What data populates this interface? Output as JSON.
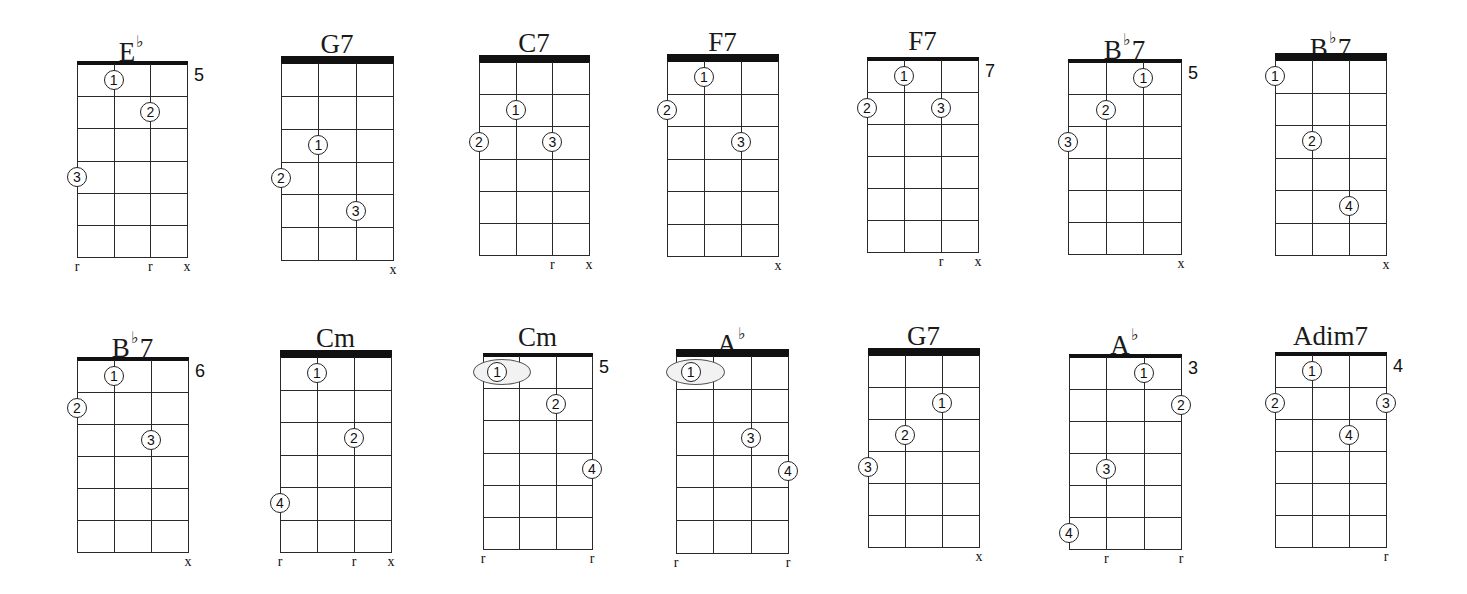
{
  "instrument": {
    "strings": 4,
    "frets_shown": 6
  },
  "colors": {
    "ink": "#111111",
    "background": "#ffffff",
    "barre_fill": "#f2f2f2"
  },
  "chords": [
    {
      "name": "E",
      "accidental": "♭",
      "suffix": "",
      "position": "5",
      "left": 77,
      "right": 187,
      "top": 64,
      "bottom": 257,
      "nut": "thin",
      "fingers": [
        {
          "n": "1",
          "s": 1,
          "f": 1
        },
        {
          "n": "2",
          "s": 2,
          "f": 2
        },
        {
          "n": "3",
          "s": 0,
          "f": 4
        }
      ],
      "markers": [
        {
          "s": 0,
          "m": "r"
        },
        {
          "s": 2,
          "m": "r"
        },
        {
          "s": 3,
          "m": "x"
        }
      ]
    },
    {
      "name": "G",
      "accidental": "",
      "suffix": "7",
      "position": "",
      "left": 281,
      "right": 393,
      "top": 63,
      "bottom": 260,
      "nut": "thick",
      "fingers": [
        {
          "n": "1",
          "s": 1,
          "f": 3
        },
        {
          "n": "2",
          "s": 0,
          "f": 4
        },
        {
          "n": "3",
          "s": 2,
          "f": 5
        }
      ],
      "markers": [
        {
          "s": 3,
          "m": "x"
        }
      ]
    },
    {
      "name": "C",
      "accidental": "",
      "suffix": "7",
      "position": "",
      "left": 479,
      "right": 589,
      "top": 62,
      "bottom": 255,
      "nut": "thick",
      "fingers": [
        {
          "n": "1",
          "s": 1,
          "f": 2
        },
        {
          "n": "2",
          "s": 0,
          "f": 3
        },
        {
          "n": "3",
          "s": 2,
          "f": 3
        }
      ],
      "markers": [
        {
          "s": 2,
          "m": "r"
        },
        {
          "s": 3,
          "m": "x"
        }
      ]
    },
    {
      "name": "F",
      "accidental": "",
      "suffix": "7",
      "position": "",
      "left": 667,
      "right": 778,
      "top": 61,
      "bottom": 256,
      "nut": "thick",
      "fingers": [
        {
          "n": "1",
          "s": 1,
          "f": 1
        },
        {
          "n": "2",
          "s": 0,
          "f": 2
        },
        {
          "n": "3",
          "s": 2,
          "f": 3
        }
      ],
      "markers": [
        {
          "s": 3,
          "m": "x"
        }
      ]
    },
    {
      "name": "F",
      "accidental": "",
      "suffix": "7",
      "position": "7",
      "left": 867,
      "right": 978,
      "top": 60,
      "bottom": 252,
      "nut": "thin",
      "fingers": [
        {
          "n": "1",
          "s": 1,
          "f": 1
        },
        {
          "n": "2",
          "s": 0,
          "f": 2
        },
        {
          "n": "3",
          "s": 2,
          "f": 2
        }
      ],
      "markers": [
        {
          "s": 2,
          "m": "r"
        },
        {
          "s": 3,
          "m": "x"
        }
      ]
    },
    {
      "name": "B",
      "accidental": "♭",
      "suffix": "7",
      "position": "5",
      "left": 1068,
      "right": 1181,
      "top": 62,
      "bottom": 254,
      "nut": "thin",
      "fingers": [
        {
          "n": "1",
          "s": 2,
          "f": 1
        },
        {
          "n": "2",
          "s": 1,
          "f": 2
        },
        {
          "n": "3",
          "s": 0,
          "f": 3
        }
      ],
      "markers": [
        {
          "s": 3,
          "m": "x"
        }
      ]
    },
    {
      "name": "B",
      "accidental": "♭",
      "suffix": "7",
      "position": "",
      "left": 1275,
      "right": 1386,
      "top": 60,
      "bottom": 255,
      "nut": "thick",
      "fingers": [
        {
          "n": "1",
          "s": 0,
          "f": 1
        },
        {
          "n": "2",
          "s": 1,
          "f": 3
        },
        {
          "n": "4",
          "s": 2,
          "f": 5
        }
      ],
      "markers": [
        {
          "s": 3,
          "m": "x"
        }
      ]
    },
    {
      "name": "B",
      "accidental": "♭",
      "suffix": "7",
      "position": "6",
      "left": 77,
      "right": 188,
      "top": 360,
      "bottom": 552,
      "nut": "thin",
      "fingers": [
        {
          "n": "1",
          "s": 1,
          "f": 1
        },
        {
          "n": "2",
          "s": 0,
          "f": 2
        },
        {
          "n": "3",
          "s": 2,
          "f": 3
        }
      ],
      "markers": [
        {
          "s": 3,
          "m": "x"
        }
      ]
    },
    {
      "name": "Cm",
      "accidental": "",
      "suffix": "",
      "position": "",
      "left": 280,
      "right": 391,
      "top": 357,
      "bottom": 552,
      "nut": "thick",
      "fingers": [
        {
          "n": "1",
          "s": 1,
          "f": 1
        },
        {
          "n": "2",
          "s": 2,
          "f": 3
        },
        {
          "n": "4",
          "s": 0,
          "f": 5
        }
      ],
      "markers": [
        {
          "s": 0,
          "m": "r"
        },
        {
          "s": 2,
          "m": "r"
        },
        {
          "s": 3,
          "m": "x"
        }
      ]
    },
    {
      "name": "Cm",
      "accidental": "",
      "suffix": "",
      "position": "5",
      "left": 483,
      "right": 592,
      "top": 356,
      "bottom": 549,
      "nut": "thin",
      "barre": {
        "f": 1,
        "from": 0,
        "to": 1,
        "n": "1"
      },
      "fingers": [
        {
          "n": "2",
          "s": 2,
          "f": 2
        },
        {
          "n": "4",
          "s": 3,
          "f": 4
        }
      ],
      "markers": [
        {
          "s": 0,
          "m": "r"
        },
        {
          "s": 3,
          "m": "r"
        }
      ]
    },
    {
      "name": "A",
      "accidental": "♭",
      "suffix": "",
      "position": "",
      "left": 676,
      "right": 788,
      "top": 356,
      "bottom": 553,
      "nut": "thick",
      "barre": {
        "f": 1,
        "from": 0,
        "to": 1,
        "n": "1"
      },
      "fingers": [
        {
          "n": "3",
          "s": 2,
          "f": 3
        },
        {
          "n": "4",
          "s": 3,
          "f": 4
        }
      ],
      "markers": [
        {
          "s": 0,
          "m": "r"
        },
        {
          "s": 3,
          "m": "r"
        }
      ]
    },
    {
      "name": "G",
      "accidental": "",
      "suffix": "7",
      "position": "",
      "left": 868,
      "right": 979,
      "top": 355,
      "bottom": 547,
      "nut": "thick",
      "fingers": [
        {
          "n": "1",
          "s": 2,
          "f": 2
        },
        {
          "n": "2",
          "s": 1,
          "f": 3
        },
        {
          "n": "3",
          "s": 0,
          "f": 4
        }
      ],
      "markers": [
        {
          "s": 3,
          "m": "x"
        }
      ]
    },
    {
      "name": "A",
      "accidental": "♭",
      "suffix": "",
      "position": "3",
      "left": 1069,
      "right": 1181,
      "top": 357,
      "bottom": 549,
      "nut": "thin",
      "fingers": [
        {
          "n": "1",
          "s": 2,
          "f": 1
        },
        {
          "n": "2",
          "s": 3,
          "f": 2
        },
        {
          "n": "3",
          "s": 1,
          "f": 4
        },
        {
          "n": "4",
          "s": 0,
          "f": 6
        }
      ],
      "markers": [
        {
          "s": 1,
          "m": "r"
        },
        {
          "s": 3,
          "m": "r"
        }
      ]
    },
    {
      "name": "Adim7",
      "accidental": "",
      "suffix": "",
      "position": "4",
      "left": 1275,
      "right": 1386,
      "top": 355,
      "bottom": 547,
      "nut": "thin",
      "fingers": [
        {
          "n": "1",
          "s": 1,
          "f": 1
        },
        {
          "n": "2",
          "s": 0,
          "f": 2
        },
        {
          "n": "3",
          "s": 3,
          "f": 2
        },
        {
          "n": "4",
          "s": 2,
          "f": 3
        }
      ],
      "markers": [
        {
          "s": 3,
          "m": "r"
        }
      ]
    }
  ]
}
